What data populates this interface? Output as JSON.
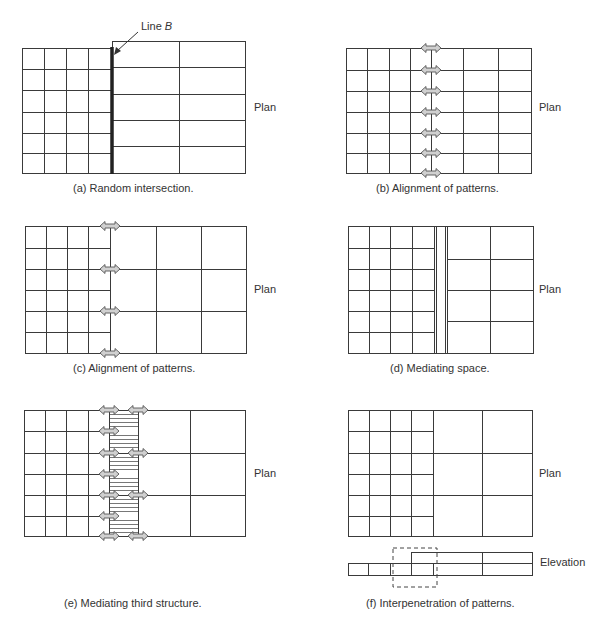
{
  "figure": {
    "panels": [
      {
        "id": "a",
        "caption": "(a)  Random intersection.",
        "view_label": "Plan",
        "annotation": "Line B"
      },
      {
        "id": "b",
        "caption": "(b)  Alignment of patterns.",
        "view_label": "Plan"
      },
      {
        "id": "c",
        "caption": "(c)  Alignment of patterns.",
        "view_label": "Plan"
      },
      {
        "id": "d",
        "caption": "(d)  Mediating space.",
        "view_label": "Plan"
      },
      {
        "id": "e",
        "caption": "(e)  Mediating third structure.",
        "view_label": "Plan"
      },
      {
        "id": "f",
        "caption": "(f)  Interpenetration of patterns.",
        "view_label": "Plan",
        "elevation_label": "Elevation"
      }
    ]
  },
  "colors": {
    "line": "#3a3a3a",
    "arrow_fill": "#d0d0d0",
    "background": "#ffffff"
  }
}
